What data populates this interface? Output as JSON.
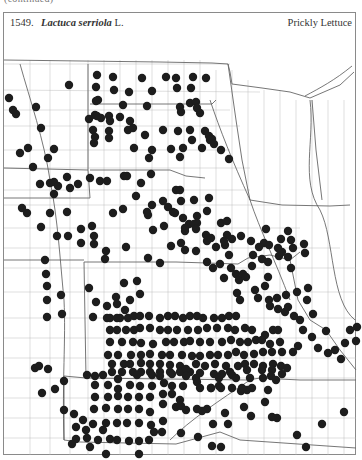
{
  "page": {
    "clipped_top_text": "(continued)",
    "header": {
      "number": "1549.",
      "genus_species": "Lactuca serriola",
      "authority": "L.",
      "common_name": "Prickly Lettuce"
    }
  },
  "map": {
    "title": "Distribution map of Lactuca serriola (Prickly Lettuce)",
    "dot_color": "#1d1d1d",
    "dot_radius": 4.2,
    "records": [
      [
        97,
        75
      ],
      [
        113,
        77
      ],
      [
        142,
        78
      ],
      [
        166,
        77
      ],
      [
        176,
        78
      ],
      [
        193,
        77
      ],
      [
        206,
        78
      ],
      [
        96,
        87
      ],
      [
        114,
        90
      ],
      [
        129,
        92
      ],
      [
        152,
        91
      ],
      [
        177,
        88
      ],
      [
        191,
        88
      ],
      [
        190,
        103
      ],
      [
        196,
        102
      ],
      [
        69,
        85
      ],
      [
        98,
        100
      ],
      [
        123,
        105
      ],
      [
        147,
        106
      ],
      [
        180,
        107
      ],
      [
        197,
        108
      ],
      [
        181,
        112
      ],
      [
        200,
        113
      ],
      [
        9,
        98
      ],
      [
        13,
        110
      ],
      [
        36,
        107
      ],
      [
        16,
        114
      ],
      [
        96,
        101
      ],
      [
        95,
        115
      ],
      [
        101,
        118
      ],
      [
        109,
        116
      ],
      [
        120,
        117
      ],
      [
        130,
        121
      ],
      [
        128,
        130
      ],
      [
        133,
        128
      ],
      [
        145,
        135
      ],
      [
        163,
        130
      ],
      [
        178,
        131
      ],
      [
        190,
        130
      ],
      [
        205,
        131
      ],
      [
        209,
        136
      ],
      [
        212,
        139
      ],
      [
        89,
        119
      ],
      [
        97,
        116
      ],
      [
        110,
        121
      ],
      [
        109,
        131
      ],
      [
        93,
        130
      ],
      [
        95,
        137
      ],
      [
        94,
        143
      ],
      [
        109,
        138
      ],
      [
        134,
        148
      ],
      [
        171,
        149
      ],
      [
        152,
        150
      ],
      [
        192,
        140
      ],
      [
        210,
        140
      ],
      [
        149,
        158
      ],
      [
        180,
        157
      ],
      [
        183,
        148
      ],
      [
        202,
        148
      ],
      [
        214,
        144
      ],
      [
        221,
        150
      ],
      [
        229,
        159
      ],
      [
        41,
        128
      ],
      [
        28,
        148
      ],
      [
        54,
        149
      ],
      [
        20,
        153
      ],
      [
        33,
        167
      ],
      [
        67,
        177
      ],
      [
        50,
        183
      ],
      [
        54,
        194
      ],
      [
        90,
        178
      ],
      [
        100,
        181
      ],
      [
        70,
        188
      ],
      [
        78,
        184
      ],
      [
        107,
        181
      ],
      [
        124,
        176
      ],
      [
        127,
        176
      ],
      [
        141,
        183
      ],
      [
        151,
        174
      ],
      [
        176,
        190
      ],
      [
        180,
        190
      ],
      [
        92,
        226
      ],
      [
        113,
        213
      ],
      [
        123,
        209
      ],
      [
        152,
        205
      ],
      [
        136,
        196
      ],
      [
        148,
        215
      ],
      [
        168,
        207
      ],
      [
        163,
        201
      ],
      [
        173,
        212
      ],
      [
        175,
        213
      ],
      [
        181,
        201
      ],
      [
        194,
        200
      ],
      [
        209,
        198
      ],
      [
        207,
        211
      ],
      [
        197,
        216
      ],
      [
        185,
        231
      ],
      [
        189,
        224
      ],
      [
        197,
        223
      ],
      [
        207,
        241
      ],
      [
        27,
        213
      ],
      [
        50,
        213
      ],
      [
        67,
        212
      ],
      [
        57,
        236
      ],
      [
        68,
        236
      ],
      [
        81,
        229
      ],
      [
        81,
        243
      ],
      [
        94,
        236
      ],
      [
        94,
        244
      ],
      [
        106,
        251
      ],
      [
        105,
        259
      ],
      [
        126,
        247
      ],
      [
        147,
        212
      ],
      [
        153,
        230
      ],
      [
        164,
        226
      ],
      [
        148,
        258
      ],
      [
        160,
        263
      ],
      [
        171,
        246
      ],
      [
        181,
        243
      ],
      [
        185,
        250
      ],
      [
        196,
        251
      ],
      [
        207,
        262
      ],
      [
        213,
        268
      ],
      [
        220,
        264
      ],
      [
        229,
        255
      ],
      [
        231,
        268
      ],
      [
        236,
        274
      ],
      [
        224,
        278
      ],
      [
        239,
        280
      ],
      [
        243,
        274
      ],
      [
        252,
        266
      ],
      [
        262,
        259
      ],
      [
        268,
        262
      ],
      [
        279,
        256
      ],
      [
        268,
        277
      ],
      [
        255,
        290
      ],
      [
        246,
        277
      ],
      [
        288,
        257
      ],
      [
        291,
        268
      ],
      [
        253,
        255
      ],
      [
        264,
        243
      ],
      [
        266,
        229
      ],
      [
        282,
        252
      ],
      [
        288,
        231
      ],
      [
        293,
        248
      ],
      [
        304,
        244
      ],
      [
        305,
        253
      ],
      [
        237,
        293
      ],
      [
        240,
        300
      ],
      [
        258,
        298
      ],
      [
        265,
        286
      ],
      [
        269,
        300
      ],
      [
        270,
        306
      ],
      [
        277,
        298
      ],
      [
        286,
        295
      ],
      [
        297,
        292
      ],
      [
        308,
        288
      ],
      [
        307,
        300
      ],
      [
        285,
        312
      ],
      [
        278,
        309
      ],
      [
        288,
        307
      ],
      [
        183,
        218
      ],
      [
        194,
        224
      ],
      [
        185,
        228
      ],
      [
        196,
        229
      ],
      [
        206,
        235
      ],
      [
        211,
        238
      ],
      [
        225,
        245
      ],
      [
        227,
        235
      ],
      [
        221,
        223
      ],
      [
        227,
        221
      ],
      [
        224,
        241
      ],
      [
        216,
        247
      ],
      [
        232,
        239
      ],
      [
        241,
        236
      ],
      [
        251,
        241
      ],
      [
        259,
        247
      ],
      [
        269,
        245
      ],
      [
        278,
        248
      ],
      [
        281,
        239
      ],
      [
        291,
        240
      ],
      [
        46,
        274
      ],
      [
        47,
        286
      ],
      [
        61,
        295
      ],
      [
        47,
        300
      ],
      [
        62,
        314
      ],
      [
        47,
        317
      ],
      [
        89,
        288
      ],
      [
        96,
        302
      ],
      [
        93,
        317
      ],
      [
        107,
        306
      ],
      [
        107,
        318
      ],
      [
        116,
        297
      ],
      [
        117,
        304
      ],
      [
        125,
        310
      ],
      [
        120,
        318
      ],
      [
        124,
        283
      ],
      [
        137,
        281
      ],
      [
        140,
        294
      ],
      [
        130,
        300
      ],
      [
        110,
        318
      ],
      [
        117,
        318
      ],
      [
        128,
        318
      ],
      [
        134,
        316
      ],
      [
        140,
        316
      ],
      [
        149,
        316
      ],
      [
        160,
        318
      ],
      [
        168,
        316
      ],
      [
        175,
        316
      ],
      [
        183,
        318
      ],
      [
        190,
        316
      ],
      [
        197,
        316
      ],
      [
        203,
        318
      ],
      [
        214,
        318
      ],
      [
        222,
        318
      ],
      [
        229,
        316
      ],
      [
        236,
        316
      ],
      [
        110,
        330
      ],
      [
        117,
        330
      ],
      [
        126,
        330
      ],
      [
        134,
        330
      ],
      [
        140,
        328
      ],
      [
        150,
        328
      ],
      [
        160,
        330
      ],
      [
        168,
        330
      ],
      [
        177,
        330
      ],
      [
        188,
        330
      ],
      [
        198,
        330
      ],
      [
        207,
        328
      ],
      [
        217,
        328
      ],
      [
        228,
        328
      ],
      [
        235,
        330
      ],
      [
        245,
        328
      ],
      [
        252,
        330
      ],
      [
        265,
        335
      ],
      [
        273,
        330
      ],
      [
        278,
        330
      ],
      [
        110,
        342
      ],
      [
        122,
        342
      ],
      [
        133,
        342
      ],
      [
        141,
        343
      ],
      [
        153,
        344
      ],
      [
        166,
        342
      ],
      [
        174,
        342
      ],
      [
        184,
        342
      ],
      [
        190,
        341
      ],
      [
        200,
        342
      ],
      [
        210,
        342
      ],
      [
        222,
        342
      ],
      [
        231,
        340
      ],
      [
        240,
        342
      ],
      [
        248,
        342
      ],
      [
        256,
        340
      ],
      [
        262,
        340
      ],
      [
        270,
        344
      ],
      [
        280,
        342
      ],
      [
        108,
        355
      ],
      [
        118,
        355
      ],
      [
        131,
        355
      ],
      [
        141,
        355
      ],
      [
        150,
        354
      ],
      [
        162,
        355
      ],
      [
        170,
        355
      ],
      [
        182,
        355
      ],
      [
        192,
        356
      ],
      [
        200,
        356
      ],
      [
        210,
        355
      ],
      [
        218,
        355
      ],
      [
        228,
        355
      ],
      [
        236,
        352
      ],
      [
        244,
        355
      ],
      [
        254,
        354
      ],
      [
        263,
        352
      ],
      [
        272,
        352
      ],
      [
        282,
        352
      ],
      [
        112,
        364
      ],
      [
        124,
        364
      ],
      [
        130,
        364
      ],
      [
        141,
        363
      ],
      [
        150,
        364
      ],
      [
        160,
        364
      ],
      [
        170,
        365
      ],
      [
        180,
        366
      ],
      [
        196,
        364
      ],
      [
        205,
        366
      ],
      [
        215,
        364
      ],
      [
        226,
        366
      ],
      [
        238,
        366
      ],
      [
        245,
        364
      ],
      [
        254,
        364
      ],
      [
        263,
        366
      ],
      [
        273,
        364
      ],
      [
        281,
        366
      ],
      [
        112,
        372
      ],
      [
        122,
        372
      ],
      [
        133,
        372
      ],
      [
        141,
        372
      ],
      [
        150,
        372
      ],
      [
        160,
        372
      ],
      [
        170,
        372
      ],
      [
        180,
        372
      ],
      [
        190,
        372
      ],
      [
        200,
        373
      ],
      [
        214,
        374
      ],
      [
        222,
        374
      ],
      [
        230,
        372
      ],
      [
        247,
        370
      ],
      [
        262,
        370
      ],
      [
        272,
        370
      ],
      [
        282,
        374
      ],
      [
        87,
        375
      ],
      [
        64,
        381
      ],
      [
        55,
        389
      ],
      [
        35,
        368
      ],
      [
        42,
        393
      ],
      [
        48,
        369
      ],
      [
        39,
        366
      ],
      [
        186,
        369
      ],
      [
        196,
        378
      ],
      [
        219,
        378
      ],
      [
        219,
        386
      ],
      [
        232,
        375
      ],
      [
        250,
        378
      ],
      [
        263,
        378
      ],
      [
        271,
        376
      ],
      [
        276,
        380
      ],
      [
        95,
        376
      ],
      [
        103,
        375
      ],
      [
        118,
        379
      ],
      [
        137,
        375
      ],
      [
        152,
        375
      ],
      [
        160,
        376
      ],
      [
        172,
        374
      ],
      [
        186,
        376
      ],
      [
        197,
        382
      ],
      [
        211,
        388
      ],
      [
        236,
        378
      ],
      [
        241,
        391
      ],
      [
        247,
        390
      ],
      [
        268,
        390
      ],
      [
        287,
        368
      ],
      [
        293,
        352
      ],
      [
        298,
        346
      ],
      [
        313,
        314
      ],
      [
        312,
        337
      ],
      [
        326,
        331
      ],
      [
        335,
        350
      ],
      [
        356,
        341
      ],
      [
        300,
        320
      ],
      [
        294,
        316
      ],
      [
        303,
        330
      ],
      [
        318,
        348
      ],
      [
        328,
        353
      ],
      [
        345,
        343
      ],
      [
        341,
        359
      ],
      [
        357,
        327
      ],
      [
        350,
        330
      ],
      [
        95,
        385
      ],
      [
        108,
        385
      ],
      [
        118,
        389
      ],
      [
        130,
        385
      ],
      [
        140,
        386
      ],
      [
        152,
        386
      ],
      [
        164,
        383
      ],
      [
        172,
        386
      ],
      [
        183,
        386
      ],
      [
        200,
        388
      ],
      [
        211,
        388
      ],
      [
        221,
        388
      ],
      [
        232,
        388
      ],
      [
        242,
        388
      ],
      [
        252,
        388
      ],
      [
        95,
        397
      ],
      [
        108,
        397
      ],
      [
        118,
        396
      ],
      [
        128,
        397
      ],
      [
        139,
        397
      ],
      [
        150,
        397
      ],
      [
        163,
        394
      ],
      [
        172,
        394
      ],
      [
        180,
        400
      ],
      [
        94,
        409
      ],
      [
        106,
        408
      ],
      [
        118,
        409
      ],
      [
        128,
        409
      ],
      [
        139,
        409
      ],
      [
        150,
        412
      ],
      [
        163,
        404
      ],
      [
        176,
        407
      ],
      [
        186,
        410
      ],
      [
        197,
        409
      ],
      [
        207,
        409
      ],
      [
        225,
        413
      ],
      [
        213,
        424
      ],
      [
        244,
        407
      ],
      [
        251,
        416
      ],
      [
        277,
        418
      ],
      [
        74,
        414
      ],
      [
        83,
        420
      ],
      [
        93,
        424
      ],
      [
        106,
        423
      ],
      [
        117,
        423
      ],
      [
        127,
        423
      ],
      [
        139,
        423
      ],
      [
        151,
        425
      ],
      [
        163,
        421
      ],
      [
        181,
        406
      ],
      [
        228,
        424
      ],
      [
        265,
        402
      ],
      [
        272,
        417
      ],
      [
        76,
        439
      ],
      [
        87,
        438
      ],
      [
        98,
        440
      ],
      [
        110,
        439
      ],
      [
        117,
        440
      ],
      [
        129,
        441
      ],
      [
        139,
        441
      ],
      [
        149,
        440
      ],
      [
        154,
        432
      ],
      [
        162,
        432
      ],
      [
        181,
        433
      ],
      [
        198,
        437
      ],
      [
        202,
        411
      ],
      [
        212,
        446
      ],
      [
        221,
        447
      ],
      [
        297,
        435
      ],
      [
        322,
        424
      ],
      [
        344,
        412
      ],
      [
        306,
        447
      ],
      [
        72,
        444
      ],
      [
        90,
        447
      ],
      [
        106,
        454
      ],
      [
        139,
        454
      ],
      [
        86,
        430
      ],
      [
        103,
        430
      ],
      [
        76,
        427
      ],
      [
        64,
        410
      ],
      [
        22,
        208
      ],
      [
        48,
        158
      ],
      [
        54,
        182
      ],
      [
        40,
        184
      ],
      [
        58,
        186
      ],
      [
        41,
        227
      ],
      [
        45,
        260
      ]
    ]
  }
}
